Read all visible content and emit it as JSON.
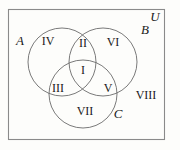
{
  "figure": {
    "type": "venn-diagram-3-set",
    "background_color": "#fdfdfb",
    "line_color": "#6b6b6b",
    "text_color": "#1a1a1a"
  },
  "universe": {
    "label": "U",
    "label_x": 155,
    "label_y": 16
  },
  "sets": [
    {
      "name": "set-a",
      "label": "A",
      "label_x": 20,
      "label_y": 40,
      "cx": 62,
      "cy": 62,
      "r": 34
    },
    {
      "name": "set-b",
      "label": "B",
      "label_x": 145,
      "label_y": 29,
      "cx": 103,
      "cy": 62,
      "r": 34
    },
    {
      "name": "set-c",
      "label": "C",
      "label_x": 118,
      "label_y": 113,
      "cx": 83,
      "cy": 94,
      "r": 34
    }
  ],
  "regions": [
    {
      "name": "region-i",
      "label": "I",
      "x": 83,
      "y": 70,
      "description": "A and B and C"
    },
    {
      "name": "region-ii",
      "label": "II",
      "x": 83,
      "y": 43,
      "description": "A and B only"
    },
    {
      "name": "region-iii",
      "label": "III",
      "x": 58,
      "y": 88,
      "description": "A and C only"
    },
    {
      "name": "region-iv",
      "label": "IV",
      "x": 48,
      "y": 41,
      "description": "A only"
    },
    {
      "name": "region-v",
      "label": "V",
      "x": 108,
      "y": 88,
      "description": "B and C only"
    },
    {
      "name": "region-vi",
      "label": "VI",
      "x": 113,
      "y": 42,
      "description": "B only"
    },
    {
      "name": "region-vii",
      "label": "VII",
      "x": 85,
      "y": 111,
      "description": "C only"
    },
    {
      "name": "region-viii",
      "label": "VIII",
      "x": 146,
      "y": 95,
      "description": "outside all sets"
    }
  ],
  "frame": {
    "x": 8,
    "y": 9,
    "width": 157,
    "height": 131
  }
}
